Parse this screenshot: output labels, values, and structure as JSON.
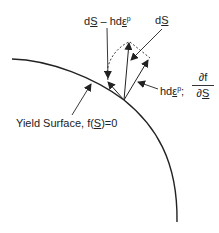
{
  "labels": {
    "ds_minus": {
      "d": "d",
      "s": "S",
      "minus": " – hd",
      "eps": "ε",
      "p": "p"
    },
    "ds": {
      "d": "d",
      "s": "S"
    },
    "hdep": {
      "h": "hd",
      "eps": "ε",
      "p": "p",
      "sep": ";"
    },
    "fraction": {
      "num": "∂f",
      "den_d": "∂",
      "den_s": "S"
    },
    "yield": {
      "prefix": "Yield Surface, f(",
      "s": "S",
      "suffix": ")=0"
    }
  },
  "colors": {
    "stroke": "#222222",
    "background": "#ffffff"
  }
}
